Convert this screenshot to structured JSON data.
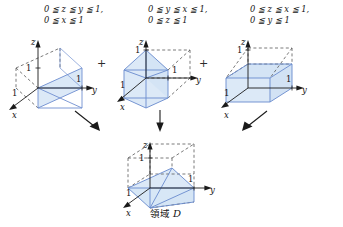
{
  "figure": {
    "title_caption": "領域 D",
    "caption_region_word": "領域",
    "caption_symbol": "D",
    "operator_plus": "+",
    "background_color": "#ffffff",
    "fill_color": "#dce9f7",
    "edge_color": "#6f8fd0",
    "dash_color": "#585858",
    "axis_color": "#1a1a1a"
  },
  "panels": [
    {
      "id": "panel-1",
      "condition_line1": "0 ≦ z ≦ y ≦ 1,",
      "condition_line2": "0 ≦ x ≦ 1",
      "axis_x": "x",
      "axis_y": "y",
      "axis_z": "z",
      "tick_x": "1",
      "tick_y": "1",
      "tick_z": "1",
      "shape": "wedge-z-under-y"
    },
    {
      "id": "panel-2",
      "condition_line1": "0 ≦ y ≦ x ≦ 1,",
      "condition_line2": "0 ≦ z ≦ 1",
      "axis_x": "x",
      "axis_y": "y",
      "axis_z": "z",
      "tick_x": "1",
      "tick_y": "1",
      "tick_z": "1",
      "shape": "prism-y-under-x"
    },
    {
      "id": "panel-3",
      "condition_line1": "0 ≦ z ≦ x ≦ 1,",
      "condition_line2": "0 ≦ y ≦ 1",
      "axis_x": "x",
      "axis_y": "y",
      "axis_z": "z",
      "tick_x": "1",
      "tick_y": "1",
      "tick_z": "1",
      "shape": "prism-z-under-x"
    }
  ],
  "result_panel": {
    "id": "panel-result",
    "axis_x": "x",
    "axis_y": "y",
    "axis_z": "z",
    "tick_x": "1",
    "tick_y": "1",
    "tick_z": "1",
    "shape": "tetra-union"
  },
  "arrows": [
    {
      "id": "arrow-left",
      "direction": "down-right"
    },
    {
      "id": "arrow-middle",
      "direction": "down"
    },
    {
      "id": "arrow-right",
      "direction": "down-left"
    }
  ]
}
